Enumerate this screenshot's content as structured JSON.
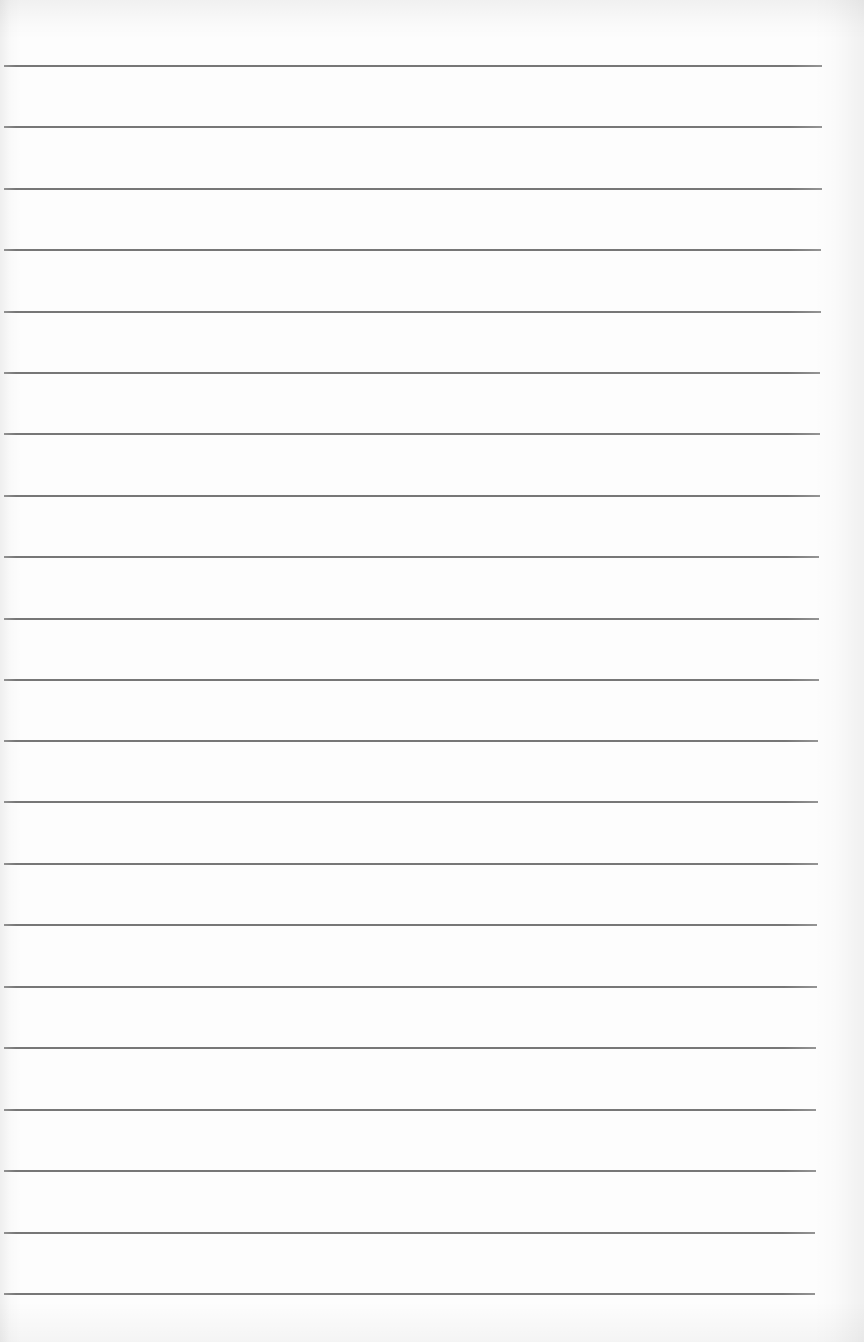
{
  "document": {
    "type": "lined-paper-sheet",
    "line_color": "#6b6b6b",
    "paper_color": "#fdfdfd",
    "rules": [
      {
        "y": 66,
        "x1": 4,
        "x2": 822
      },
      {
        "y": 127,
        "x1": 4,
        "x2": 822
      },
      {
        "y": 189,
        "x1": 4,
        "x2": 822
      },
      {
        "y": 250,
        "x1": 4,
        "x2": 821
      },
      {
        "y": 312,
        "x1": 4,
        "x2": 821
      },
      {
        "y": 373,
        "x1": 4,
        "x2": 820
      },
      {
        "y": 434,
        "x1": 4,
        "x2": 820
      },
      {
        "y": 496,
        "x1": 4,
        "x2": 820
      },
      {
        "y": 557,
        "x1": 4,
        "x2": 819
      },
      {
        "y": 619,
        "x1": 4,
        "x2": 819
      },
      {
        "y": 680,
        "x1": 4,
        "x2": 819
      },
      {
        "y": 741,
        "x1": 4,
        "x2": 818
      },
      {
        "y": 802,
        "x1": 4,
        "x2": 818
      },
      {
        "y": 864,
        "x1": 4,
        "x2": 818
      },
      {
        "y": 925,
        "x1": 4,
        "x2": 817
      },
      {
        "y": 987,
        "x1": 4,
        "x2": 817
      },
      {
        "y": 1048,
        "x1": 4,
        "x2": 816
      },
      {
        "y": 1110,
        "x1": 4,
        "x2": 816
      },
      {
        "y": 1171,
        "x1": 4,
        "x2": 816
      },
      {
        "y": 1233,
        "x1": 4,
        "x2": 815
      },
      {
        "y": 1294,
        "x1": 4,
        "x2": 815
      }
    ]
  }
}
